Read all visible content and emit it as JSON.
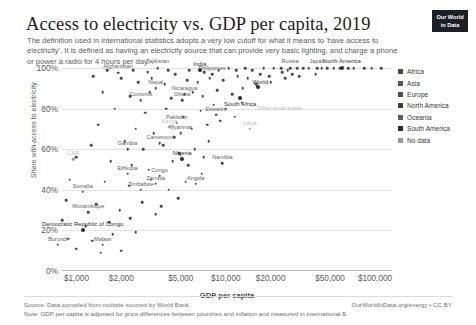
{
  "header": {
    "title": "Access to electricity vs. GDP per capita, 2019",
    "subtitle": "The definition used in international statistics adopts a very low cutoff for what it means to 'have access to electricity'. It is defined as having an electricity source that can provide very basic lighting, and charge a phone or power a radio for 4 hours per day.",
    "logo_line1": "Our World",
    "logo_line2": "in Data"
  },
  "footer": {
    "source": "Source: Data compiled from multiple sources by World Bank",
    "note": "Note: GDP per capita is adjusted for price differences between countries and inflation and measured in international-$.",
    "credit": "OurWorldInData.org/energy • CC BY"
  },
  "legend": {
    "items": [
      {
        "label": "Africa",
        "color": "#4a4a4a"
      },
      {
        "label": "Asia",
        "color": "#565656"
      },
      {
        "label": "Europe",
        "color": "#4f4f4f"
      },
      {
        "label": "North America",
        "color": "#3f3f3f"
      },
      {
        "label": "Oceania",
        "color": "#5e5e5e"
      },
      {
        "label": "South America",
        "color": "#2e2e2e"
      },
      {
        "label": "No data",
        "color": "#9a9a9a"
      }
    ]
  },
  "chart_data": {
    "type": "scatter",
    "title": "Access to electricity vs. GDP per capita, 2019",
    "xlabel": "GDP per capita",
    "ylabel": "Share with access to electricity",
    "xscale": "log",
    "xlim": [
      800,
      130000
    ],
    "ylim": [
      0,
      100
    ],
    "grid": true,
    "legend_position": "right",
    "xticks": [
      "$1,000",
      "$2,000",
      "$5,000",
      "$10,000",
      "$20,000",
      "$50,000",
      "$100,000"
    ],
    "xtick_values": [
      1000,
      2000,
      5000,
      10000,
      20000,
      50000,
      100000
    ],
    "yticks": [
      "0%",
      "20%",
      "40%",
      "60%",
      "80%",
      "100%"
    ],
    "ytick_values": [
      0,
      20,
      40,
      60,
      80,
      100
    ],
    "annotation": "Other small states",
    "points": [
      {
        "name": "Afghanistan",
        "x": 1900,
        "y": 97.7,
        "label": true
      },
      {
        "name": "Tajikistan",
        "x": 3500,
        "y": 100,
        "label": true
      },
      {
        "name": "India",
        "x": 6700,
        "y": 99,
        "label": true
      },
      {
        "name": "Philippines",
        "x": 8100,
        "y": 96.9,
        "label": true
      },
      {
        "name": "World",
        "x": 16500,
        "y": 90.4,
        "label": true
      },
      {
        "name": "Russia",
        "x": 27000,
        "y": 100,
        "label": true
      },
      {
        "name": "Japan",
        "x": 41000,
        "y": 100,
        "label": true
      },
      {
        "name": "North America",
        "x": 60000,
        "y": 100,
        "label": true
      },
      {
        "name": "Nepal",
        "x": 3400,
        "y": 90,
        "label": true
      },
      {
        "name": "Nicaragua",
        "x": 5300,
        "y": 87,
        "label": true
      },
      {
        "name": "Comoros",
        "x": 2700,
        "y": 84,
        "label": true
      },
      {
        "name": "Ghana",
        "x": 5100,
        "y": 84,
        "label": true
      },
      {
        "name": "South Africa",
        "x": 12500,
        "y": 85,
        "label": true
      },
      {
        "name": "Eswatini",
        "x": 8600,
        "y": 77,
        "label": true
      },
      {
        "name": "Pakistan",
        "x": 4700,
        "y": 73,
        "label": true
      },
      {
        "name": "Myanmar",
        "x": 5000,
        "y": 68,
        "label": true
      },
      {
        "name": "Libya",
        "x": 14500,
        "y": 70,
        "label": true
      },
      {
        "name": "Kenya",
        "x": 4200,
        "y": 71,
        "label": true
      },
      {
        "name": "Cameroon",
        "x": 3600,
        "y": 63,
        "label": true
      },
      {
        "name": "Gambia",
        "x": 2200,
        "y": 60,
        "label": true
      },
      {
        "name": "Central African Republic",
        "x": 950,
        "y": 55,
        "label": true
      },
      {
        "name": "Nigeria",
        "x": 5100,
        "y": 55,
        "label": true
      },
      {
        "name": "Namibia",
        "x": 9500,
        "y": 53,
        "label": true
      },
      {
        "name": "Ethiopia",
        "x": 2200,
        "y": 48,
        "label": true
      },
      {
        "name": "Congo",
        "x": 3600,
        "y": 47,
        "label": true
      },
      {
        "name": "Zambia",
        "x": 3400,
        "y": 43,
        "label": true
      },
      {
        "name": "Angola",
        "x": 6300,
        "y": 43,
        "label": true
      },
      {
        "name": "Zimbabwe",
        "x": 2700,
        "y": 40,
        "label": true
      },
      {
        "name": "Somalia",
        "x": 1100,
        "y": 39,
        "label": true
      },
      {
        "name": "Mozambique",
        "x": 1200,
        "y": 29,
        "label": true
      },
      {
        "name": "Democratic Republic of Congo",
        "x": 1100,
        "y": 20,
        "label": true
      },
      {
        "name": "Burundi",
        "x": 750,
        "y": 13,
        "label": true
      },
      {
        "name": "Malawi",
        "x": 1500,
        "y": 13,
        "label": true
      }
    ]
  }
}
